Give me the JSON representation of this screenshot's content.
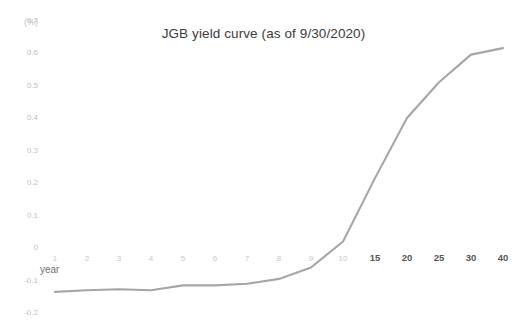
{
  "chart_data": {
    "type": "line",
    "title": "JGB yield curve (as of 9/30/2020)",
    "xlabel": "year",
    "ylabel": "(%)",
    "x": [
      1,
      2,
      3,
      4,
      5,
      6,
      7,
      8,
      9,
      10,
      15,
      20,
      25,
      30,
      40
    ],
    "categories": [
      "1",
      "2",
      "3",
      "4",
      "5",
      "6",
      "7",
      "8",
      "9",
      "10",
      "15",
      "20",
      "25",
      "30",
      "40"
    ],
    "values": [
      -0.135,
      -0.13,
      -0.127,
      -0.13,
      -0.115,
      -0.115,
      -0.11,
      -0.095,
      -0.06,
      0.02,
      0.215,
      0.4,
      0.51,
      0.595,
      0.615
    ],
    "series": [
      {
        "name": "JGB yield",
        "values": [
          -0.135,
          -0.13,
          -0.127,
          -0.13,
          -0.115,
          -0.115,
          -0.11,
          -0.095,
          -0.06,
          0.02,
          0.215,
          0.4,
          0.51,
          0.595,
          0.615
        ]
      }
    ],
    "ylim": [
      -0.2,
      0.7
    ],
    "yticks": [
      0.7,
      0.6,
      0.5,
      0.4,
      0.3,
      0.2,
      0.1,
      0,
      -0.1,
      -0.2
    ],
    "ytick_labels": [
      "0.7",
      "0.6",
      "0.5",
      "0.4",
      "0.3",
      "0.2",
      "0.1",
      "0",
      "-0.1",
      "-0.2"
    ],
    "xtick_labels": [
      "1",
      "2",
      "3",
      "4",
      "5",
      "6",
      "7",
      "8",
      "9",
      "10",
      "15",
      "20",
      "25",
      "30",
      "40"
    ],
    "xtick_emphasis": [
      false,
      false,
      false,
      false,
      false,
      false,
      false,
      false,
      false,
      false,
      true,
      true,
      true,
      true,
      true
    ],
    "grid": false,
    "legend": "none",
    "line_color": "#a6a6a6",
    "axis_label_color": "#c6c6c6",
    "title_color": "#3b3b3b"
  }
}
